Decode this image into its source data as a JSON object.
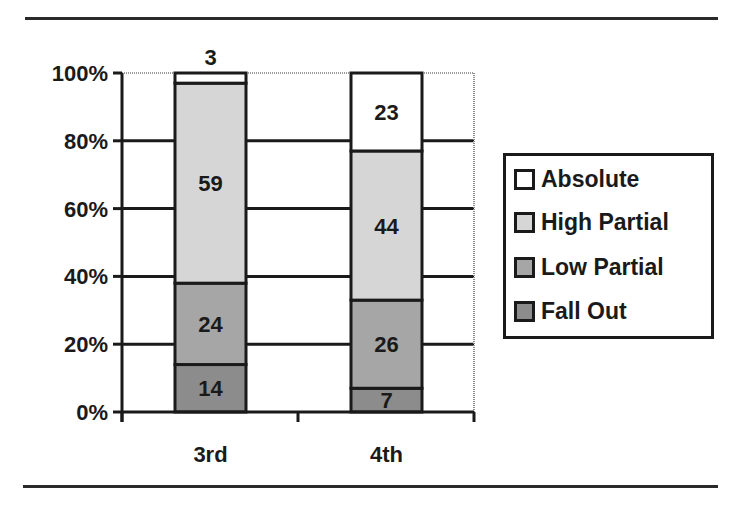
{
  "chart_data": {
    "type": "bar",
    "stacked": "percent",
    "title": "",
    "xlabel": "",
    "ylabel": "",
    "categories": [
      "3rd",
      "4th"
    ],
    "series": [
      {
        "name": "Fall Out",
        "values": [
          14,
          7
        ],
        "color": "#8c8c8c"
      },
      {
        "name": "Low Partial",
        "values": [
          24,
          26
        ],
        "color": "#a6a6a6"
      },
      {
        "name": "High Partial",
        "values": [
          59,
          44
        ],
        "color": "#d6d6d6"
      },
      {
        "name": "Absolute",
        "values": [
          3,
          23
        ],
        "color": "#ffffff"
      }
    ],
    "ylim": [
      0,
      100
    ],
    "yticks": [
      "0%",
      "20%",
      "40%",
      "60%",
      "80%",
      "100%"
    ],
    "grid": true,
    "legend_position": "right",
    "legend_order": [
      "Absolute",
      "High Partial",
      "Low Partial",
      "Fall Out"
    ]
  },
  "legend": {
    "items": [
      {
        "label": "Absolute",
        "color": "#ffffff"
      },
      {
        "label": "High Partial",
        "color": "#d6d6d6"
      },
      {
        "label": "Low Partial",
        "color": "#a6a6a6"
      },
      {
        "label": "Fall Out",
        "color": "#8c8c8c"
      }
    ]
  }
}
